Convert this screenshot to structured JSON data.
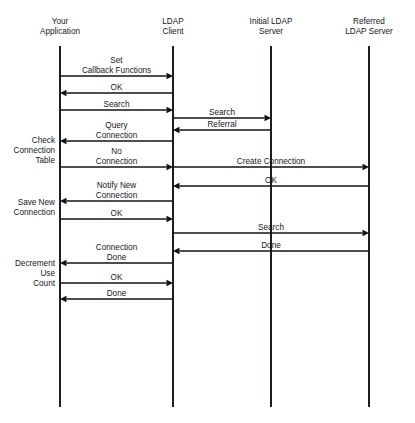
{
  "diagram": {
    "type": "sequence-diagram",
    "width": 415,
    "height": 423,
    "background_color": "#ffffff",
    "line_color": "#101315",
    "text_color": "#15181c",
    "lifelines": [
      {
        "id": "app",
        "label_lines": [
          "Your",
          "Application"
        ],
        "x": 60,
        "top": 46,
        "bottom": 407
      },
      {
        "id": "client",
        "label_lines": [
          "LDAP",
          "Client"
        ],
        "x": 173,
        "top": 46,
        "bottom": 407
      },
      {
        "id": "initial",
        "label_lines": [
          "Initial LDAP",
          "Server"
        ],
        "x": 271,
        "top": 46,
        "bottom": 407
      },
      {
        "id": "referred",
        "label_lines": [
          "Referred",
          "LDAP Server"
        ],
        "x": 369,
        "top": 46,
        "bottom": 407
      }
    ],
    "header_line_y": [
      24,
      34
    ],
    "messages": [
      {
        "id": "m1",
        "label_lines": [
          "Set",
          "Callback Functions"
        ],
        "from": "app",
        "to": "client",
        "y": 76,
        "direction": "right"
      },
      {
        "id": "m2",
        "label_lines": [
          "OK"
        ],
        "from": "client",
        "to": "app",
        "y": 93,
        "direction": "left"
      },
      {
        "id": "m3",
        "label_lines": [
          "Search"
        ],
        "from": "app",
        "to": "client",
        "y": 110,
        "direction": "right"
      },
      {
        "id": "m4",
        "label_lines": [
          "Search"
        ],
        "from": "client",
        "to": "initial",
        "y": 118,
        "direction": "right"
      },
      {
        "id": "m5",
        "label_lines": [
          "Referral"
        ],
        "from": "initial",
        "to": "client",
        "y": 130,
        "direction": "left"
      },
      {
        "id": "m6",
        "label_lines": [
          "Query",
          "Connection"
        ],
        "from": "client",
        "to": "app",
        "y": 141,
        "direction": "left"
      },
      {
        "id": "m7",
        "label_lines": [
          "No",
          "Connection"
        ],
        "from": "app",
        "to": "client",
        "y": 167,
        "direction": "right"
      },
      {
        "id": "m8",
        "label_lines": [
          "Create Connection"
        ],
        "from": "client",
        "to": "referred",
        "y": 167,
        "direction": "right"
      },
      {
        "id": "m9",
        "label_lines": [
          "OK"
        ],
        "from": "referred",
        "to": "client",
        "y": 186,
        "direction": "left"
      },
      {
        "id": "m10",
        "label_lines": [
          "Notify New",
          "Connection"
        ],
        "from": "client",
        "to": "app",
        "y": 201,
        "direction": "left"
      },
      {
        "id": "m11",
        "label_lines": [
          "OK"
        ],
        "from": "app",
        "to": "client",
        "y": 219,
        "direction": "right"
      },
      {
        "id": "m12",
        "label_lines": [
          "Search"
        ],
        "from": "client",
        "to": "referred",
        "y": 233,
        "direction": "right"
      },
      {
        "id": "m13",
        "label_lines": [
          "Done"
        ],
        "from": "referred",
        "to": "client",
        "y": 251,
        "direction": "left"
      },
      {
        "id": "m14",
        "label_lines": [
          "Connection",
          "Done"
        ],
        "from": "client",
        "to": "app",
        "y": 263,
        "direction": "left"
      },
      {
        "id": "m15",
        "label_lines": [
          "OK"
        ],
        "from": "app",
        "to": "client",
        "y": 283,
        "direction": "right"
      },
      {
        "id": "m16",
        "label_lines": [
          "Done"
        ],
        "from": "client",
        "to": "app",
        "y": 299,
        "direction": "left"
      }
    ],
    "side_notes": [
      {
        "id": "n1",
        "label_lines": [
          "Check",
          "Connection",
          "Table"
        ],
        "x": 55,
        "y": 143
      },
      {
        "id": "n2",
        "label_lines": [
          "Save New",
          "Connection"
        ],
        "x": 55,
        "y": 205
      },
      {
        "id": "n3",
        "label_lines": [
          "Decrement",
          "Use",
          "Count"
        ],
        "x": 55,
        "y": 266
      }
    ]
  }
}
